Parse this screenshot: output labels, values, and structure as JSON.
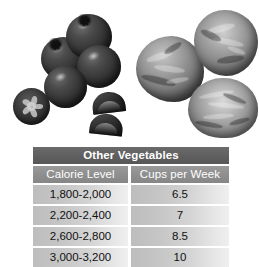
{
  "photo": {
    "description": "Photograph of fresh vegetables above a data table",
    "items": [
      {
        "name": "tomato-cluster",
        "label": "Tomatoes"
      },
      {
        "name": "tomato-slice",
        "label": "Tomato cross-section slice"
      },
      {
        "name": "tomato-wedge",
        "label": "Tomato wedge"
      },
      {
        "name": "cabbage-head",
        "label": "Cabbage head"
      }
    ]
  },
  "table": {
    "title": "Other Vegetables",
    "columns": [
      "Calorie Level",
      "Cups per Week"
    ],
    "rows": [
      {
        "calorie_level": "1,800-2,000",
        "cups_per_week": "6.5"
      },
      {
        "calorie_level": "2,200-2,400",
        "cups_per_week": "7"
      },
      {
        "calorie_level": "2,600-2,800",
        "cups_per_week": "8.5"
      },
      {
        "calorie_level": "3,000-3,200",
        "cups_per_week": "10"
      }
    ]
  },
  "colors": {
    "title_bar": "#606060",
    "header_bar": "#8e8e8e",
    "row_fill_left": "#bdbdbd",
    "row_fill_right": "#efefef",
    "page_background": "#ffffff",
    "title_text": "#ffffff",
    "body_text": "#111111"
  }
}
